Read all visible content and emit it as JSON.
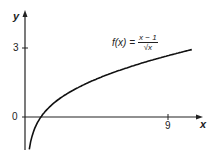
{
  "chart_data": {
    "type": "line",
    "title": "",
    "function": "f(x) = (x - 1) / sqrt(x)",
    "xlabel": "x",
    "ylabel": "y",
    "x_ticks": [
      "9"
    ],
    "y_ticks": [
      "0",
      "3"
    ],
    "xlim": [
      0,
      10.6
    ],
    "ylim": [
      -1.6,
      4
    ],
    "grid": false,
    "series": [
      {
        "name": "f(x) = (x - 1)/√x",
        "x": [
          0.1,
          0.3,
          0.6,
          1,
          2,
          3,
          4,
          5,
          6,
          7,
          8,
          9,
          10.5
        ],
        "values": [
          -2.85,
          -1.28,
          -0.52,
          0,
          0.71,
          1.15,
          1.5,
          1.79,
          2.04,
          2.27,
          2.47,
          2.67,
          2.93
        ]
      }
    ],
    "annotations": [
      {
        "text": "f(x) = (x − 1)/√x",
        "position": "upper right near curve"
      }
    ]
  },
  "labels": {
    "y_axis": "y",
    "x_axis": "x",
    "tick_y3": "3",
    "tick_y0": "0",
    "tick_x9": "9",
    "formula_lhs": "f(x) =",
    "formula_num": "x − 1",
    "formula_den": "√x"
  }
}
